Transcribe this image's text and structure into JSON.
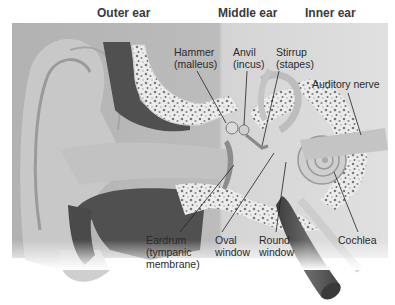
{
  "regions": [
    {
      "id": "outer",
      "label": "Outer ear"
    },
    {
      "id": "middle",
      "label": "Middle ear"
    },
    {
      "id": "inner",
      "label": "Inner ear"
    }
  ],
  "labels": {
    "hammer": {
      "line1": "Hammer",
      "line2": "(malleus)"
    },
    "anvil": {
      "line1": "Anvil",
      "line2": "(incus)"
    },
    "stirrup": {
      "line1": "Stirrup",
      "line2": "(stapes)"
    },
    "auditory_nerve": {
      "line1": "Auditory nerve"
    },
    "eardrum": {
      "line1": "Eardrum",
      "line2": "(tympanic",
      "line3": "membrane)"
    },
    "oval_window": {
      "line1": "Oval",
      "line2": "window"
    },
    "round_window": {
      "line1": "Round",
      "line2": "window"
    },
    "cochlea": {
      "line1": "Cochlea"
    }
  },
  "colors": {
    "outer_bg": "#b4b4b4",
    "middle_bg": "#d2d2d2",
    "inner_bg": "#dcdcdc",
    "canal": "#5a5a5a",
    "bone": "#e8e8e8",
    "label_text": "#2a2a2a"
  }
}
